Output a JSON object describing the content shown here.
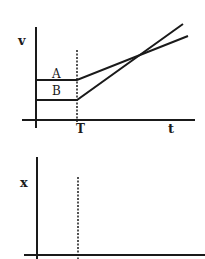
{
  "diagram": {
    "top_graph": {
      "y_axis_label": "v",
      "x_axis_label": "t",
      "marker_label": "T",
      "line_labels": [
        "A",
        "B"
      ]
    },
    "bottom_graph": {
      "y_axis_label": "x"
    },
    "colors": {
      "ink": "#1a1a1a",
      "background": "#ffffff"
    }
  }
}
